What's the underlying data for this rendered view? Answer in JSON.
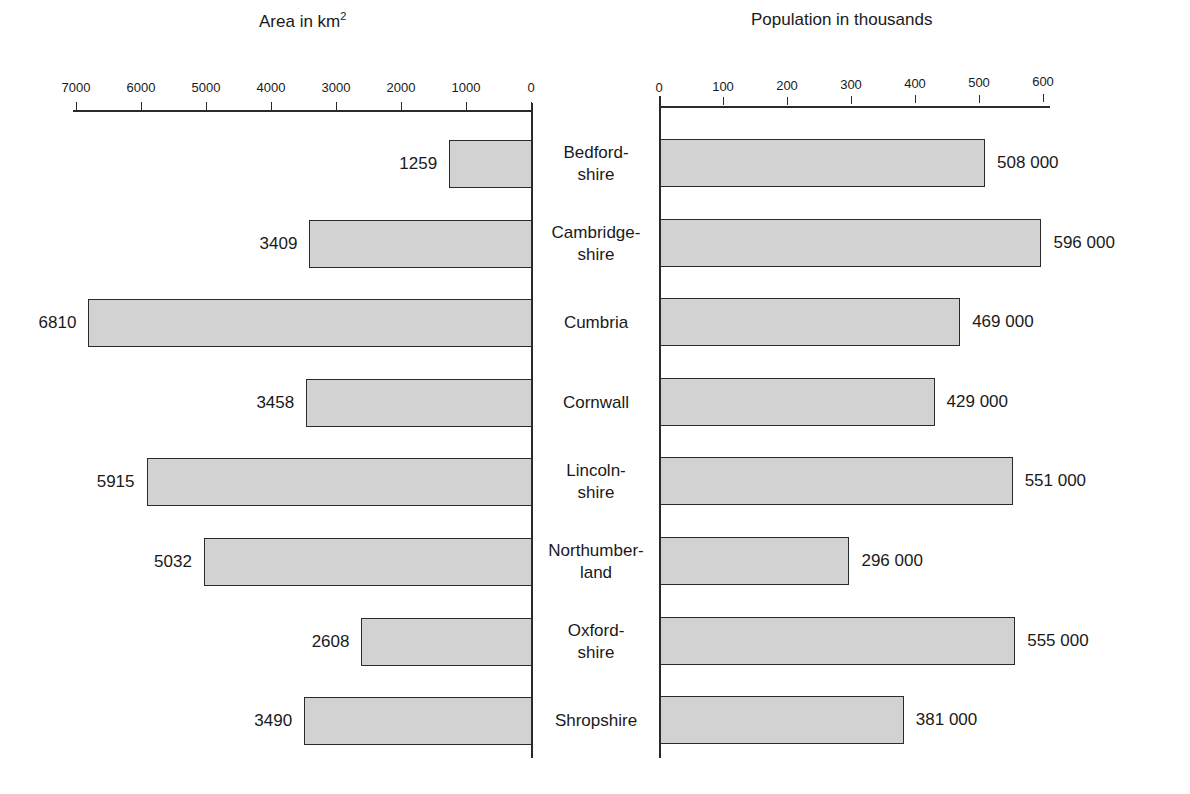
{
  "chart_data": {
    "type": "bar",
    "orientation": "horizontal",
    "layout": "back-to-back (butterfly)",
    "categories": [
      "Bedford-\nshire",
      "Cambridge-\nshire",
      "Cumbria",
      "Cornwall",
      "Lincoln-\nshire",
      "Northumber-\nland",
      "Oxford-\nshire",
      "Shropshire"
    ],
    "series": [
      {
        "name": "Area in km²",
        "side": "left",
        "values": [
          1259,
          3409,
          6810,
          3458,
          5915,
          5032,
          2608,
          3490
        ],
        "value_labels": [
          "1259",
          "3409",
          "6810",
          "3458",
          "5915",
          "5032",
          "2608",
          "3490"
        ]
      },
      {
        "name": "Population in thousands",
        "side": "right",
        "values": [
          508000,
          596000,
          469000,
          429000,
          551000,
          296000,
          555000,
          381000
        ],
        "value_labels": [
          "508 000",
          "596 000",
          "469 000",
          "429 000",
          "551 000",
          "296 000",
          "555 000",
          "381 000"
        ]
      }
    ],
    "left_axis": {
      "title": "Area in km",
      "title_sup": "2",
      "ticks": [
        "7000",
        "6000",
        "5000",
        "4000",
        "3000",
        "2000",
        "1000",
        "0"
      ],
      "range": [
        7000,
        0
      ]
    },
    "right_axis": {
      "title": "Population in thousands",
      "ticks": [
        "0",
        "100",
        "200",
        "300",
        "400",
        "500",
        "600"
      ],
      "range": [
        0,
        600
      ]
    },
    "grid": false,
    "legend": "none",
    "colors": {
      "bar_fill": "#d2d2d2",
      "bar_stroke": "#2a2a2a"
    }
  }
}
